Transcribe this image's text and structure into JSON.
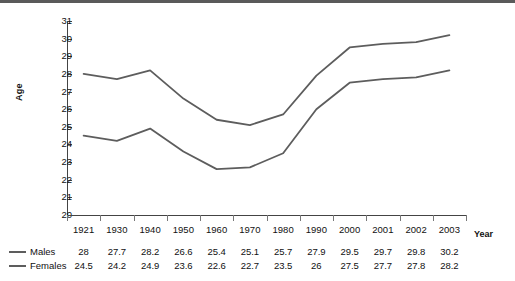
{
  "chart_data": {
    "type": "line",
    "title": "",
    "xlabel": "Year",
    "ylabel": "Age",
    "categories": [
      "1921",
      "1930",
      "1940",
      "1950",
      "1960",
      "1970",
      "1980",
      "1990",
      "2000",
      "2001",
      "2002",
      "2003"
    ],
    "series": [
      {
        "name": "Males",
        "values": [
          28,
          27.7,
          28.2,
          26.6,
          25.4,
          25.1,
          25.7,
          27.9,
          29.5,
          29.7,
          29.8,
          30.2
        ]
      },
      {
        "name": "Females",
        "values": [
          24.5,
          24.2,
          24.9,
          23.6,
          22.6,
          22.7,
          23.5,
          26,
          27.5,
          27.7,
          27.8,
          28.2
        ]
      }
    ],
    "series_value_labels": [
      [
        "28",
        "27.7",
        "28.2",
        "26.6",
        "25.4",
        "25.1",
        "25.7",
        "27.9",
        "29.5",
        "29.7",
        "29.8",
        "30.2"
      ],
      [
        "24.5",
        "24.2",
        "24.9",
        "23.6",
        "22.6",
        "22.7",
        "23.5",
        "26",
        "27.5",
        "27.7",
        "27.8",
        "28.2"
      ]
    ],
    "ylim": [
      20,
      31
    ],
    "yticks": [
      20,
      21,
      22,
      23,
      24,
      25,
      26,
      27,
      28,
      29,
      30,
      31
    ],
    "ytick_labels": [
      "20",
      "21",
      "22",
      "23",
      "24",
      "25",
      "26",
      "27",
      "28",
      "29",
      "30",
      "31"
    ],
    "grid": false,
    "legend_position": "bottom-left",
    "line_color": "#5d5d5d"
  }
}
